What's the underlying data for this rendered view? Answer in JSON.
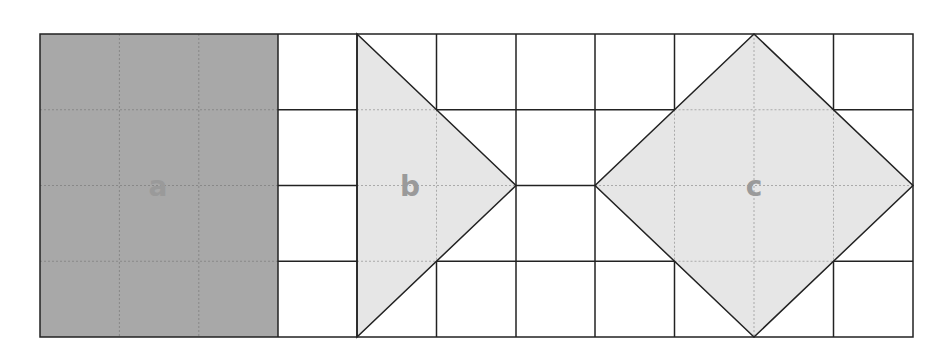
{
  "diagram": {
    "grid": {
      "columns": 11,
      "rows": 4,
      "left": 40,
      "top": 34,
      "right": 913,
      "bottom": 337
    },
    "shapes": [
      {
        "id": "a",
        "label": "a",
        "type": "rectangle",
        "description": "3x4 rectangle",
        "fill": "#a8a8a8"
      },
      {
        "id": "b",
        "label": "b",
        "type": "triangle",
        "description": "triangle base 4 cells, height 2 cells",
        "fill": "#e6e6e6"
      },
      {
        "id": "c",
        "label": "c",
        "type": "square-diamond",
        "description": "rotated square with diagonals 4 cells",
        "fill": "#e6e6e6"
      }
    ],
    "colors": {
      "line": "#222222",
      "dark_fill": "#a8a8a8",
      "light_fill": "#e6e6e6",
      "label": "#9a9a9a"
    }
  }
}
